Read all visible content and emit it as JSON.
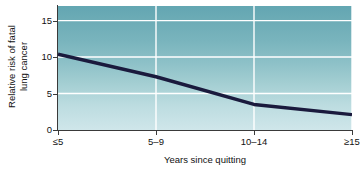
{
  "chart_data": {
    "type": "line",
    "title": "",
    "subtitle": "",
    "xlabel": "Years since quitting",
    "ylabel": "Relative risk of fatal lung cancer",
    "ylabel_line1": "Relative risk of fatal",
    "ylabel_line2": "lung cancer",
    "categories": [
      "≤5",
      "5–9",
      "10–14",
      "≥15"
    ],
    "values": [
      10.4,
      7.3,
      3.5,
      2.1
    ],
    "series": [
      {
        "name": "Relative risk of fatal lung cancer",
        "values": [
          10.4,
          7.3,
          3.5,
          2.1
        ],
        "color": "#1a1a3d"
      }
    ],
    "ylim": [
      0,
      17
    ],
    "yticks": [
      0,
      5,
      10,
      15
    ],
    "ytick_labels": [
      "0",
      "5",
      "10",
      "15"
    ],
    "xtick_labels": [
      "≤5",
      "5–9",
      "10–14",
      "≥15"
    ],
    "grid": true,
    "grid_color": "#ffffff",
    "legend": null,
    "legend_position": "none",
    "annotations": [],
    "plot_background_top_color": "#63a6b2",
    "plot_background_bottom_color": "#cfe6ea",
    "axis_color": "#3a3a3a",
    "text_color": "#111111"
  }
}
